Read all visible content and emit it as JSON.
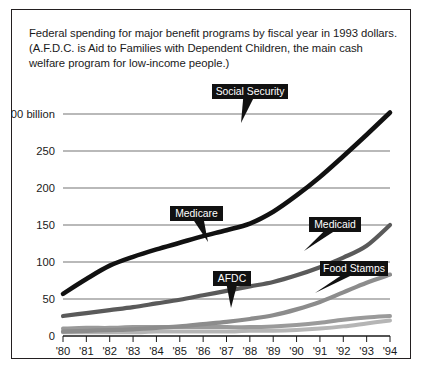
{
  "caption": "Federal spending for major benefit programs by fiscal year in 1993 dollars. (A.F.D.C. is Aid to Families with Dependent Children, the main cash welfare program for low-income people.)",
  "chart_data": {
    "type": "line",
    "title": "Federal spending for major benefit programs by fiscal year in 1993 dollars.",
    "xlabel": "",
    "ylabel": "",
    "ylim": [
      0,
      300
    ],
    "xlim": [
      "'80",
      "'94"
    ],
    "grid": true,
    "legend_position": "inline-callouts",
    "unit": "billions of 1993 dollars",
    "categories": [
      "'80",
      "'81",
      "'82",
      "'83",
      "'84",
      "'85",
      "'86",
      "'87",
      "'88",
      "'89",
      "'90",
      "'91",
      "'92",
      "'93",
      "'94"
    ],
    "ytick_labels": [
      "$300 billion",
      "250",
      "200",
      "150",
      "100",
      "50",
      "0"
    ],
    "ytick_values": [
      300,
      250,
      200,
      150,
      100,
      50,
      0
    ],
    "series": [
      {
        "name": "Social Security",
        "color": "#111111",
        "width": 4.6,
        "values": [
          57,
          77,
          95,
          107,
          117,
          126,
          135,
          143,
          152,
          168,
          190,
          215,
          243,
          272,
          302
        ]
      },
      {
        "name": "Medicare",
        "color": "#5a5a5a",
        "width": 4.2,
        "values": [
          27,
          31,
          35,
          39,
          44,
          49,
          55,
          61,
          67,
          73,
          82,
          93,
          106,
          122,
          150
        ]
      },
      {
        "name": "Medicaid",
        "color": "#8c8c8c",
        "width": 4.2,
        "values": [
          6,
          7,
          8,
          9,
          11,
          13,
          16,
          19,
          23,
          28,
          36,
          46,
          59,
          72,
          83
        ]
      },
      {
        "name": "Food Stamps",
        "color": "#9a9a9a",
        "width": 4.0,
        "values": [
          10,
          11,
          11,
          12,
          12,
          12,
          12,
          12,
          12,
          13,
          15,
          18,
          22,
          25,
          27
        ]
      },
      {
        "name": "AFDC",
        "color": "#b5b5b5",
        "width": 4.0,
        "values": [
          5,
          5,
          5,
          5,
          6,
          6,
          6,
          6,
          7,
          7,
          8,
          10,
          13,
          17,
          21
        ]
      }
    ],
    "callouts": [
      {
        "label": "Social Security",
        "box_x": 200,
        "box_y": 74,
        "box_w": 76,
        "box_h": 15,
        "tip_x": 229,
        "tip_y": 113
      },
      {
        "label": "Medicare",
        "box_x": 158,
        "box_y": 196,
        "box_w": 53,
        "box_h": 15,
        "tip_x": 196,
        "tip_y": 232
      },
      {
        "label": "Medicaid",
        "box_x": 297,
        "box_y": 207,
        "box_w": 52,
        "box_h": 15,
        "tip_x": 292,
        "tip_y": 241
      },
      {
        "label": "Food Stamps",
        "box_x": 308,
        "box_y": 251,
        "box_w": 68,
        "box_h": 15,
        "tip_x": 303,
        "tip_y": 283
      },
      {
        "label": "AFDC",
        "box_x": 201,
        "box_y": 261,
        "box_w": 38,
        "box_h": 15,
        "tip_x": 219,
        "tip_y": 298
      }
    ]
  }
}
